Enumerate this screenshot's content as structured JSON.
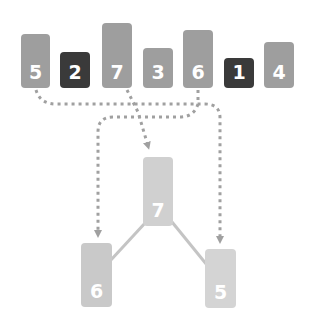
{
  "colors": {
    "light_bar": "#9e9e9e",
    "dark_bar": "#3a3a3a",
    "tree_root": "#d0d0d0",
    "tree_left": "#c9c9c9",
    "tree_right": "#d4d4d4",
    "dotted_path": "#a0a0a0",
    "tree_edge": "#c4c4c4"
  },
  "array": {
    "items": [
      {
        "label": "5",
        "highlight": false
      },
      {
        "label": "2",
        "highlight": true
      },
      {
        "label": "7",
        "highlight": false
      },
      {
        "label": "3",
        "highlight": false
      },
      {
        "label": "6",
        "highlight": false
      },
      {
        "label": "1",
        "highlight": true
      },
      {
        "label": "4",
        "highlight": false
      }
    ]
  },
  "tree": {
    "root": {
      "label": "7"
    },
    "left": {
      "label": "6"
    },
    "right": {
      "label": "5"
    }
  }
}
